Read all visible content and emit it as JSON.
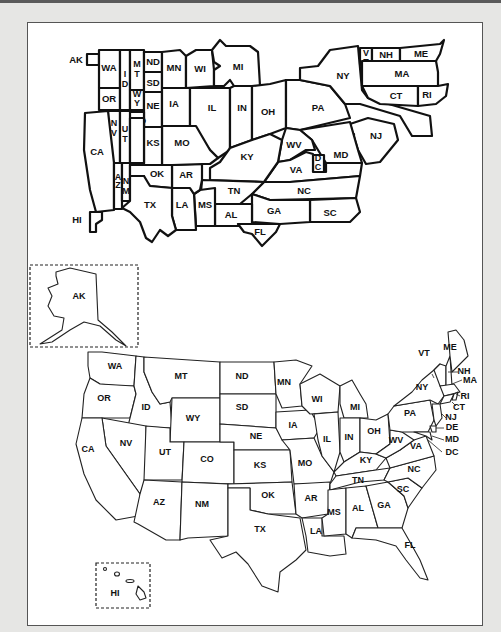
{
  "document": {
    "type": "scanned page",
    "figures": [
      "schematic-state-map",
      "geographic-state-map"
    ]
  },
  "schematic_map": {
    "labels": {
      "AK": "AK",
      "HI": "HI",
      "WA": "WA",
      "OR": "OR",
      "CA": "CA",
      "ID": "I D",
      "NV": "N V",
      "UT": "U T",
      "AZ": "A Z",
      "MT": "M T",
      "WY": "W Y",
      "CO": "CO",
      "NM": "N M",
      "ND": "ND",
      "SD": "SD",
      "NE": "NE",
      "KS": "KS",
      "OK": "OK",
      "TX": "TX",
      "MN": "MN",
      "IA": "IA",
      "MO": "MO",
      "AR": "AR",
      "LA": "LA",
      "WI": "WI",
      "IL": "IL",
      "MS": "MS",
      "MI": "MI",
      "IN": "IN",
      "KY": "KY",
      "TN": "TN",
      "AL": "AL",
      "OH": "OH",
      "WV": "WV",
      "VA": "VA",
      "NC": "NC",
      "SC": "SC",
      "GA": "GA",
      "FL": "FL",
      "PA": "PA",
      "NY": "NY",
      "NJ": "NJ",
      "DE": "DE",
      "MD": "MD",
      "DC": "D C",
      "VT": "V T",
      "NH": "NH",
      "ME": "ME",
      "MA": "MA",
      "CT": "CT",
      "RI": "RI"
    }
  },
  "geographic_map": {
    "labels": {
      "AK": "AK",
      "HI": "HI",
      "WA": "WA",
      "OR": "OR",
      "CA": "CA",
      "NV": "NV",
      "ID": "ID",
      "MT": "MT",
      "WY": "WY",
      "UT": "UT",
      "CO": "CO",
      "AZ": "AZ",
      "NM": "NM",
      "ND": "ND",
      "SD": "SD",
      "NE": "NE",
      "KS": "KS",
      "OK": "OK",
      "TX": "TX",
      "MN": "MN",
      "IA": "IA",
      "MO": "MO",
      "AR": "AR",
      "LA": "LA",
      "WI": "WI",
      "IL": "IL",
      "MI": "MI",
      "IN": "IN",
      "OH": "OH",
      "KY": "KY",
      "TN": "TN",
      "MS": "MS",
      "AL": "AL",
      "GA": "GA",
      "FL": "FL",
      "SC": "SC",
      "NC": "NC",
      "VA": "VA",
      "WV": "WV",
      "PA": "PA",
      "NY": "NY",
      "VT": "VT",
      "NH": "NH",
      "ME": "ME",
      "MA": "MA",
      "RI": "RI",
      "CT": "CT",
      "NJ": "NJ",
      "DE": "DE",
      "MD": "MD",
      "DC": "DC"
    },
    "insets": [
      "Alaska",
      "Hawaii"
    ]
  },
  "colors": {
    "ink": "#111111",
    "paper": "#ffffff",
    "background": "#e6e6e4"
  }
}
